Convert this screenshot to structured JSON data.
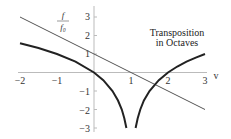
{
  "chart_data": {
    "type": "line",
    "title": "",
    "annotation": [
      "Transposition",
      "in Octaves"
    ],
    "xlabel": "v",
    "ylabel": {
      "numerator": "f",
      "denominator": "f0"
    },
    "xlim": [
      -2,
      3
    ],
    "ylim": [
      -3,
      3.4
    ],
    "xticks": [
      -2,
      -1,
      1,
      2,
      3
    ],
    "yticks": [
      -3,
      -2,
      -1,
      1,
      2,
      3
    ],
    "grid": false,
    "series": [
      {
        "name": "f/f0 = 1 - v",
        "style": "thin",
        "color": "#555555",
        "x": [
          -2,
          3
        ],
        "y": [
          3,
          -2
        ]
      },
      {
        "name": "log2|1 - v| (left branch)",
        "style": "thick",
        "color": "#222222",
        "x": [
          -2,
          -1.5,
          -1,
          -0.5,
          0,
          0.25,
          0.5,
          0.65,
          0.75,
          0.82,
          0.875
        ],
        "y": [
          1.585,
          1.322,
          1.0,
          0.585,
          0.0,
          -0.415,
          -1.0,
          -1.515,
          -2.0,
          -2.474,
          -3.0
        ]
      },
      {
        "name": "log2|1 - v| (right branch)",
        "style": "thick",
        "color": "#222222",
        "x": [
          1.125,
          1.18,
          1.25,
          1.35,
          1.5,
          1.75,
          2.0,
          2.25,
          2.5,
          2.75,
          3.0
        ],
        "y": [
          -3.0,
          -2.474,
          -2.0,
          -1.515,
          -1.0,
          -0.415,
          0.0,
          0.322,
          0.585,
          0.807,
          1.0
        ]
      }
    ]
  },
  "labels": {
    "x_ticks": [
      "−2",
      "−1",
      "1",
      "2",
      "3"
    ],
    "y_ticks": [
      "3",
      "2",
      "1",
      "−1",
      "−2",
      "−3"
    ],
    "x_axis": "v",
    "y_num": "f",
    "y_den": "f₀",
    "annot_line1": "Transposition",
    "annot_line2": "in Octaves"
  },
  "colors": {
    "axis": "#bbbbbb",
    "thin_line": "#555555",
    "thick_curve": "#222222"
  }
}
